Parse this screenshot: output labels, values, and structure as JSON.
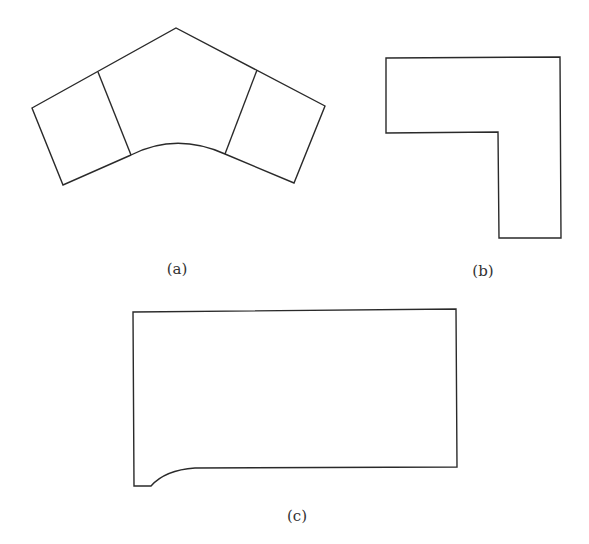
{
  "figure": {
    "panels": [
      {
        "id": "a",
        "label": "(a)",
        "description": "Bent three-section shape: two end quadrilaterals joined by a central section with a peaked top edge and a curved bottom edge",
        "label_position": {
          "x": 177,
          "y": 260
        },
        "outline": "M32,108 L176,28 L325,106 L294,183 L225,154 Q176,132 131,155 L63,185 Z",
        "dividers": [
          "M98,72 L131,155",
          "M257,70 L225,154"
        ]
      },
      {
        "id": "b",
        "label": "(b)",
        "description": "L-shaped polygon",
        "label_position": {
          "x": 483,
          "y": 262
        },
        "outline": "M386,58 L560,57 L561,238 L499,238 L498,132 L386,133 Z",
        "dividers": []
      },
      {
        "id": "c",
        "label": "(c)",
        "description": "Rectangle with a curved fillet notch at the bottom-left corner",
        "label_position": {
          "x": 297,
          "y": 507
        },
        "outline": "M133,312 L456,309 L457,467 L195,468 Q165,470 151,486 L134,486 Z",
        "dividers": []
      }
    ],
    "colors": {
      "stroke": "#2a2a2a",
      "fill": "#ffffff",
      "background": "#ffffff",
      "caption": "#333333"
    }
  }
}
